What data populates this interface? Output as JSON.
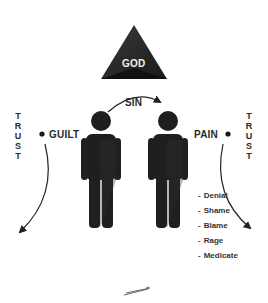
{
  "diagram": {
    "top_node": {
      "label": "GOD",
      "shape": "triangle",
      "color": "#2b2b2b"
    },
    "arrow_top": {
      "label": "SIN",
      "direction": "left-to-right"
    },
    "left": {
      "vertical_label": "T\nR\nU\nS\nT",
      "point_label": "GUILT"
    },
    "right": {
      "vertical_label": "T\nR\nU\nS\nT",
      "point_label": "PAIN"
    },
    "figures": [
      {
        "id": "left-person",
        "color": "#1f1f1f"
      },
      {
        "id": "right-person",
        "color": "#1f1f1f"
      }
    ],
    "responses": [
      {
        "label": "Denial"
      },
      {
        "label": "Shame"
      },
      {
        "label": "Blame"
      },
      {
        "label": "Rage"
      },
      {
        "label": "Medicate"
      }
    ],
    "footer_mark": "scribble-signature"
  }
}
